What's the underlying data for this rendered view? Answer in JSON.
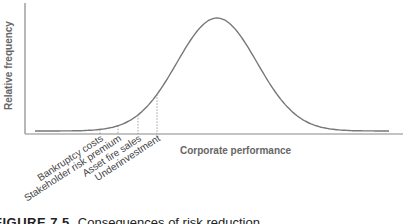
{
  "chart_data": {
    "type": "line",
    "title": "",
    "xlabel": "Corporate performance",
    "ylabel": "Relative frequency",
    "curve": "normal distribution (bell curve)",
    "annotations": [
      {
        "label": "Bankruptcy costs",
        "x_px": 100
      },
      {
        "label": "Stakeholder risk premium",
        "x_px": 118
      },
      {
        "label": "Asset fire sales",
        "x_px": 138
      },
      {
        "label": "Underinvestment",
        "x_px": 157
      }
    ],
    "grid": false,
    "legend": "none"
  },
  "figure": {
    "label": "FIGURE 7.5",
    "caption": "Consequences of risk reduction"
  }
}
